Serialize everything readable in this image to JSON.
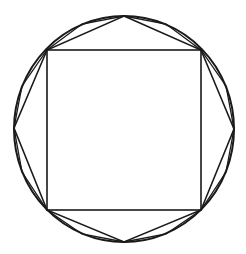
{
  "diagram": {
    "title": "",
    "colors": {
      "stroke": "#1a1a1a",
      "background": "#ffffff"
    },
    "circle": {
      "cx": 124,
      "cy": 129,
      "rx": 110,
      "ry": 113
    },
    "square": {
      "x1": 47,
      "y1": 50,
      "x2": 201,
      "y2": 210
    },
    "octagon_vertices": [
      [
        124,
        16
      ],
      [
        201,
        50
      ],
      [
        234,
        129
      ],
      [
        201,
        210
      ],
      [
        124,
        242
      ],
      [
        47,
        210
      ],
      [
        14,
        128
      ],
      [
        47,
        50
      ]
    ],
    "sixteen_gon_vertices": [
      [
        124,
        16
      ],
      [
        166,
        24
      ],
      [
        201,
        50
      ],
      [
        226,
        86
      ],
      [
        234,
        129
      ],
      [
        226,
        172
      ],
      [
        201,
        210
      ],
      [
        166,
        234
      ],
      [
        124,
        242
      ],
      [
        82,
        234
      ],
      [
        47,
        210
      ],
      [
        22,
        172
      ],
      [
        14,
        128
      ],
      [
        22,
        86
      ],
      [
        47,
        50
      ],
      [
        82,
        24
      ]
    ]
  }
}
